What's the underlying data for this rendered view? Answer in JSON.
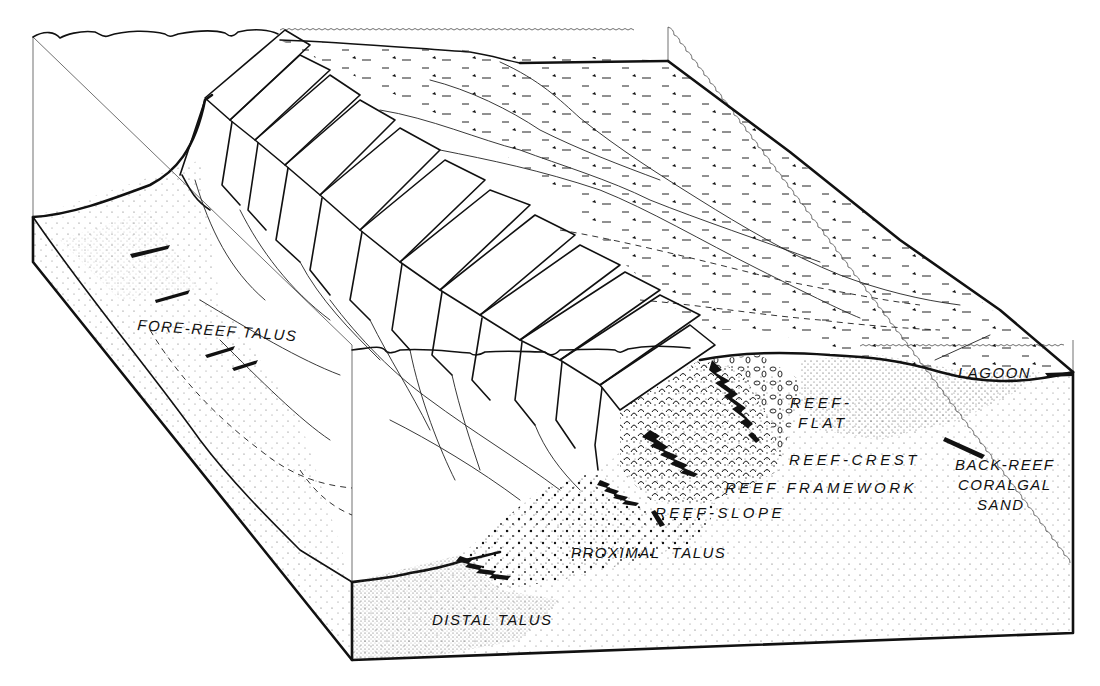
{
  "figure": {
    "type": "block-diagram",
    "colors": {
      "ink": "#111111",
      "paper": "#ffffff"
    }
  },
  "labels": {
    "fore_reef_talus": "FORE-REEF TALUS",
    "lagoon": "LAGOON",
    "reef_flat_1": "REEF-",
    "reef_flat_2": "FLAT",
    "reef_crest": "REEF-CREST",
    "reef_framework": "REEF FRAMEWORK",
    "reef_slope": "REEF-SLOPE",
    "back_reef_1": "BACK-REEF",
    "back_reef_2": "CORALGAL",
    "back_reef_3": "SAND",
    "proximal_talus": "PROXIMAL  TALUS",
    "distal_talus": "DISTAL TALUS"
  }
}
